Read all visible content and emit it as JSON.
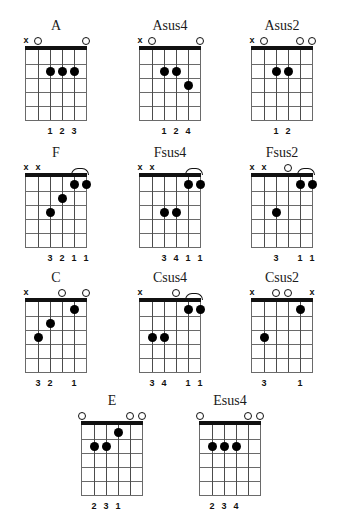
{
  "page": {
    "type": "guitar-chord-chart",
    "string_count": 6,
    "fret_count": 5,
    "symbols": {
      "muted": "x",
      "open": "o"
    }
  },
  "chords": [
    {
      "name": "A",
      "row": 0,
      "col": 0,
      "markers": [
        "x",
        "o",
        "",
        "",
        "",
        "o"
      ],
      "dots": [
        {
          "string": 4,
          "fret": 2
        },
        {
          "string": 3,
          "fret": 2
        },
        {
          "string": 2,
          "fret": 2
        }
      ],
      "barres": [],
      "fingers": [
        "",
        "",
        "1",
        "2",
        "3",
        ""
      ]
    },
    {
      "name": "Asus4",
      "row": 0,
      "col": 1,
      "markers": [
        "x",
        "o",
        "",
        "",
        "",
        "o"
      ],
      "dots": [
        {
          "string": 4,
          "fret": 2
        },
        {
          "string": 3,
          "fret": 2
        },
        {
          "string": 2,
          "fret": 3
        }
      ],
      "barres": [],
      "fingers": [
        "",
        "",
        "1",
        "2",
        "4",
        ""
      ]
    },
    {
      "name": "Asus2",
      "row": 0,
      "col": 2,
      "markers": [
        "x",
        "o",
        "",
        "",
        "o",
        "o"
      ],
      "dots": [
        {
          "string": 4,
          "fret": 2
        },
        {
          "string": 3,
          "fret": 2
        }
      ],
      "barres": [],
      "fingers": [
        "",
        "",
        "1",
        "2",
        "",
        ""
      ]
    },
    {
      "name": "F",
      "row": 1,
      "col": 0,
      "markers": [
        "x",
        "x",
        "",
        "",
        "",
        ""
      ],
      "dots": [
        {
          "string": 4,
          "fret": 3
        },
        {
          "string": 3,
          "fret": 2
        },
        {
          "string": 2,
          "fret": 1
        },
        {
          "string": 1,
          "fret": 1
        }
      ],
      "barres": [
        {
          "from_string": 2,
          "to_string": 1,
          "fret": 1
        }
      ],
      "fingers": [
        "",
        "",
        "3",
        "2",
        "1",
        "1"
      ]
    },
    {
      "name": "Fsus4",
      "row": 1,
      "col": 1,
      "markers": [
        "x",
        "x",
        "",
        "",
        "",
        ""
      ],
      "dots": [
        {
          "string": 4,
          "fret": 3
        },
        {
          "string": 3,
          "fret": 3
        },
        {
          "string": 2,
          "fret": 1
        },
        {
          "string": 1,
          "fret": 1
        }
      ],
      "barres": [
        {
          "from_string": 2,
          "to_string": 1,
          "fret": 1
        }
      ],
      "fingers": [
        "",
        "",
        "3",
        "4",
        "1",
        "1"
      ]
    },
    {
      "name": "Fsus2",
      "row": 1,
      "col": 2,
      "markers": [
        "x",
        "x",
        "",
        "o",
        "",
        ""
      ],
      "dots": [
        {
          "string": 4,
          "fret": 3
        },
        {
          "string": 2,
          "fret": 1
        },
        {
          "string": 1,
          "fret": 1
        }
      ],
      "barres": [
        {
          "from_string": 2,
          "to_string": 1,
          "fret": 1
        }
      ],
      "fingers": [
        "",
        "",
        "3",
        "",
        "1",
        "1"
      ]
    },
    {
      "name": "C",
      "row": 2,
      "col": 0,
      "markers": [
        "x",
        "",
        "",
        "o",
        "",
        "o"
      ],
      "dots": [
        {
          "string": 5,
          "fret": 3
        },
        {
          "string": 4,
          "fret": 2
        },
        {
          "string": 2,
          "fret": 1
        }
      ],
      "barres": [],
      "fingers": [
        "",
        "3",
        "2",
        "",
        "1",
        ""
      ]
    },
    {
      "name": "Csus4",
      "row": 2,
      "col": 1,
      "markers": [
        "x",
        "",
        "",
        "o",
        "",
        ""
      ],
      "dots": [
        {
          "string": 5,
          "fret": 3
        },
        {
          "string": 4,
          "fret": 3
        },
        {
          "string": 2,
          "fret": 1
        },
        {
          "string": 1,
          "fret": 1
        }
      ],
      "barres": [
        {
          "from_string": 2,
          "to_string": 1,
          "fret": 1
        }
      ],
      "fingers": [
        "",
        "3",
        "4",
        "",
        "1",
        "1"
      ]
    },
    {
      "name": "Csus2",
      "row": 2,
      "col": 2,
      "markers": [
        "x",
        "",
        "o",
        "o",
        "",
        "x"
      ],
      "dots": [
        {
          "string": 5,
          "fret": 3
        },
        {
          "string": 2,
          "fret": 1
        }
      ],
      "barres": [],
      "fingers": [
        "",
        "3",
        "",
        "",
        "1",
        ""
      ]
    },
    {
      "name": "E",
      "row": 3,
      "col": 0,
      "markers": [
        "o",
        "",
        "",
        "",
        "o",
        "o"
      ],
      "dots": [
        {
          "string": 5,
          "fret": 2
        },
        {
          "string": 4,
          "fret": 2
        },
        {
          "string": 3,
          "fret": 1
        }
      ],
      "barres": [],
      "fingers": [
        "",
        "2",
        "3",
        "1",
        "",
        ""
      ]
    },
    {
      "name": "Esus4",
      "row": 3,
      "col": 1,
      "markers": [
        "o",
        "",
        "",
        "",
        "o",
        "o"
      ],
      "dots": [
        {
          "string": 5,
          "fret": 2
        },
        {
          "string": 4,
          "fret": 2
        },
        {
          "string": 3,
          "fret": 2
        }
      ],
      "barres": [],
      "fingers": [
        "",
        "2",
        "3",
        "4",
        "",
        ""
      ]
    }
  ]
}
